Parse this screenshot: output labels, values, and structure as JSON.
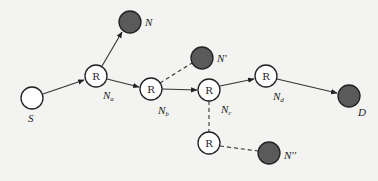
{
  "diagram": {
    "type": "network-routing",
    "nodes": [
      {
        "id": "S",
        "label": "S",
        "kind": "source",
        "fill": "#ffffff",
        "x": 32,
        "y": 98
      },
      {
        "id": "Na",
        "label": "N",
        "sub": "a",
        "router": "R",
        "kind": "router",
        "fill": "#ffffff",
        "x": 96,
        "y": 76
      },
      {
        "id": "N",
        "label": "N",
        "kind": "node",
        "fill": "#5a5a5a",
        "x": 130,
        "y": 22
      },
      {
        "id": "Nb",
        "label": "N",
        "sub": "b",
        "router": "R",
        "kind": "router",
        "fill": "#ffffff",
        "x": 151,
        "y": 89
      },
      {
        "id": "N1",
        "label": "N'",
        "kind": "node",
        "fill": "#5a5a5a",
        "x": 202,
        "y": 58
      },
      {
        "id": "Nc",
        "label": "N",
        "sub": "c",
        "router": "R",
        "kind": "router",
        "fill": "#ffffff",
        "x": 209,
        "y": 90
      },
      {
        "id": "Nd",
        "label": "N",
        "sub": "d",
        "router": "R",
        "kind": "router",
        "fill": "#ffffff",
        "x": 266,
        "y": 76
      },
      {
        "id": "D",
        "label": "D",
        "kind": "destination",
        "fill": "#5a5a5a",
        "x": 349,
        "y": 96
      },
      {
        "id": "R2",
        "router": "R",
        "kind": "router",
        "fill": "#ffffff",
        "x": 209,
        "y": 143
      },
      {
        "id": "N2",
        "label": "N''",
        "kind": "node",
        "fill": "#5a5a5a",
        "x": 269,
        "y": 153
      }
    ],
    "edges": [
      {
        "from": "S",
        "to": "Na",
        "style": "solid",
        "arrow": true
      },
      {
        "from": "Na",
        "to": "N",
        "style": "solid",
        "arrow": true
      },
      {
        "from": "Na",
        "to": "Nb",
        "style": "solid",
        "arrow": true
      },
      {
        "from": "Nb",
        "to": "Nc",
        "style": "solid",
        "arrow": true
      },
      {
        "from": "Nb",
        "to": "N1",
        "style": "dashed",
        "arrow": false
      },
      {
        "from": "Nc",
        "to": "Nd",
        "style": "solid",
        "arrow": true
      },
      {
        "from": "Nd",
        "to": "D",
        "style": "solid",
        "arrow": true
      },
      {
        "from": "Nc",
        "to": "R2",
        "style": "dashed",
        "arrow": false
      },
      {
        "from": "R2",
        "to": "N2",
        "style": "dashed",
        "arrow": false
      }
    ]
  },
  "labels": {
    "S": "S",
    "D": "D",
    "N": "N",
    "N1": "N'",
    "N2": "N''",
    "N_main": "N",
    "sub_a": "a",
    "sub_b": "b",
    "sub_c": "c",
    "sub_d": "d",
    "router": "R"
  }
}
